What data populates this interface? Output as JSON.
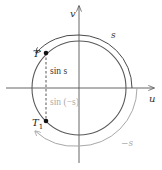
{
  "figure": {
    "type": "unit-circle-diagram",
    "colors": {
      "dark": "#4a4a4a",
      "light": "#a8a8a8",
      "point": "#111111",
      "background": "#ffffff"
    },
    "axes": {
      "horizontal_label": "u",
      "vertical_label": "v"
    },
    "points": {
      "T": {
        "label": "T"
      },
      "T1": {
        "label": "T",
        "subscript": "1"
      }
    },
    "labels": {
      "sin_s": "sin s",
      "sin_neg_s": "sin (−s)",
      "arc_s": "s",
      "arc_neg_s": "−s"
    }
  }
}
